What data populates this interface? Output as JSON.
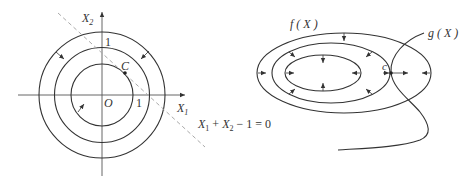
{
  "left_diagram": {
    "axis_x_label": "X",
    "axis_x_sub": "1",
    "axis_y_label": "X",
    "axis_y_sub": "2",
    "origin_label": "O",
    "point_label": "C",
    "tick_x": "1",
    "tick_y": "1",
    "constraint_line": {
      "x1": "X",
      "s1": "1",
      "op1": " + ",
      "x2": "X",
      "s2": "2",
      "rest": " − 1 = 0"
    },
    "circles": 3,
    "colors": {
      "stroke": "#333333",
      "dashed": "#aaaaaa"
    }
  },
  "right_diagram": {
    "objective_label": "f ( X )",
    "constraint_label": "g ( X )",
    "point_label": "c",
    "ellipses": 3,
    "colors": {
      "stroke": "#333333"
    }
  }
}
